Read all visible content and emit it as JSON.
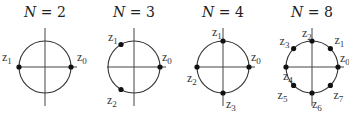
{
  "figure": {
    "panels": [
      {
        "title_var": "N",
        "title_eq": " = ",
        "title_val": "2",
        "center": [
          45,
          67
        ],
        "radius": 26,
        "points": [
          {
            "name": "z",
            "sub": "0",
            "angle_deg": 0,
            "label_dx": 6,
            "label_dy": -6,
            "anchor": "start"
          },
          {
            "name": "z",
            "sub": "1",
            "angle_deg": 180,
            "label_dx": -17,
            "label_dy": -6,
            "anchor": "start"
          }
        ]
      },
      {
        "title_var": "N",
        "title_eq": " = ",
        "title_val": "3",
        "center": [
          134,
          67
        ],
        "radius": 26,
        "points": [
          {
            "name": "z",
            "sub": "0",
            "angle_deg": 0,
            "label_dx": 2,
            "label_dy": -6,
            "anchor": "start"
          },
          {
            "name": "z",
            "sub": "1",
            "angle_deg": 120,
            "label_dx": -13,
            "label_dy": -4,
            "anchor": "start"
          },
          {
            "name": "z",
            "sub": "2",
            "angle_deg": 240,
            "label_dx": -14,
            "label_dy": 14,
            "anchor": "start"
          }
        ]
      },
      {
        "title_var": "N",
        "title_eq": " = ",
        "title_val": "4",
        "center": [
          223,
          67
        ],
        "radius": 26,
        "points": [
          {
            "name": "z",
            "sub": "0",
            "angle_deg": 0,
            "label_dx": 2,
            "label_dy": -6,
            "anchor": "start"
          },
          {
            "name": "z",
            "sub": "1",
            "angle_deg": 90,
            "label_dx": -11,
            "label_dy": -5,
            "anchor": "start"
          },
          {
            "name": "z",
            "sub": "2",
            "angle_deg": 180,
            "label_dx": -10,
            "label_dy": 15,
            "anchor": "start"
          },
          {
            "name": "z",
            "sub": "3",
            "angle_deg": 270,
            "label_dx": 3,
            "label_dy": 15,
            "anchor": "start"
          }
        ]
      },
      {
        "title_var": "N",
        "title_eq": " = ",
        "title_val": "8",
        "center": [
          312,
          67
        ],
        "radius": 26,
        "points": [
          {
            "name": "z",
            "sub": "0",
            "angle_deg": 0,
            "label_dx": 2,
            "label_dy": -5,
            "anchor": "start"
          },
          {
            "name": "z",
            "sub": "1",
            "angle_deg": 45,
            "label_dx": 4,
            "label_dy": -5,
            "anchor": "start"
          },
          {
            "name": "z",
            "sub": "2",
            "angle_deg": 90,
            "label_dx": -10,
            "label_dy": -4,
            "anchor": "start"
          },
          {
            "name": "z",
            "sub": "3",
            "angle_deg": 135,
            "label_dx": -14,
            "label_dy": -4,
            "anchor": "start"
          },
          {
            "name": "z",
            "sub": "4",
            "angle_deg": 180,
            "label_dx": -3,
            "label_dy": 13,
            "anchor": "start"
          },
          {
            "name": "z",
            "sub": "5",
            "angle_deg": 225,
            "label_dx": -16,
            "label_dy": 14,
            "anchor": "start"
          },
          {
            "name": "z",
            "sub": "6",
            "angle_deg": 270,
            "label_dx": 0,
            "label_dy": 15,
            "anchor": "start"
          },
          {
            "name": "z",
            "sub": "7",
            "angle_deg": 315,
            "label_dx": 3,
            "label_dy": 14,
            "anchor": "start"
          }
        ]
      }
    ],
    "axis_extent": {
      "left": 27,
      "right": 32,
      "up": 39,
      "down": 39
    },
    "colors": {
      "line": "#333333",
      "point": "#111111",
      "text": "#222222"
    }
  }
}
